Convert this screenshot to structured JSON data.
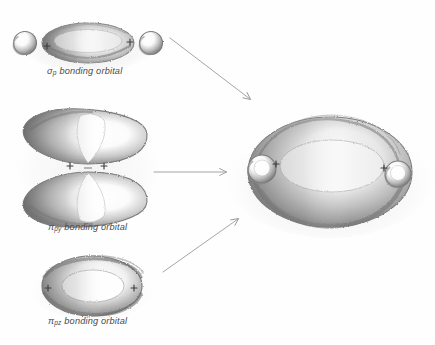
{
  "figure": {
    "medium": "pencil sketch",
    "background_color": "#fefefe",
    "ink_color": "#6b6b6b",
    "sign_marks": "+"
  },
  "orbitals": [
    {
      "id": "sigma-p",
      "symbol": "σ",
      "subscript": "p",
      "label_text": "bonding orbital",
      "full_label": "σp bonding orbital",
      "shape": "prolate ellipsoid with two small end spheres",
      "plus_marks": 2,
      "position": {
        "x": 88,
        "y": 44
      }
    },
    {
      "id": "pi-py",
      "symbol": "π",
      "subscript": "py",
      "label_text": "bonding orbital",
      "full_label": "πpy bonding orbital",
      "shape": "two opposed lobes pinched at center",
      "plus_marks": 2,
      "position": {
        "x": 88,
        "y": 165
      }
    },
    {
      "id": "pi-pz",
      "symbol": "π",
      "subscript": "pz",
      "label_text": "bonding orbital",
      "full_label": "πpz bonding orbital",
      "shape": "elongated torus ring",
      "plus_marks": 2,
      "position": {
        "x": 88,
        "y": 285
      }
    }
  ],
  "composite": {
    "id": "triple-bond-orbital",
    "shape": "large ellipsoidal cloud with two small lateral spheres",
    "plus_marks": 2,
    "position": {
      "x": 330,
      "y": 172
    }
  },
  "arrows": [
    {
      "id": "arrow-sigma",
      "from": [
        168,
        38
      ],
      "to": [
        252,
        100
      ],
      "direction": "down-right"
    },
    {
      "id": "arrow-pi-py",
      "from": [
        152,
        172
      ],
      "to": [
        228,
        172
      ],
      "direction": "right"
    },
    {
      "id": "arrow-pi-pz",
      "from": [
        163,
        272
      ],
      "to": [
        240,
        218
      ],
      "direction": "up-right"
    }
  ],
  "labels": {
    "sigma_p": {
      "symbol": "σ",
      "sub": "p",
      "text": "bonding orbital"
    },
    "pi_py": {
      "symbol": "π",
      "sub": "py",
      "text": "bonding orbital"
    },
    "pi_pz": {
      "symbol": "π",
      "sub": "pz",
      "text": "bonding orbital"
    }
  }
}
